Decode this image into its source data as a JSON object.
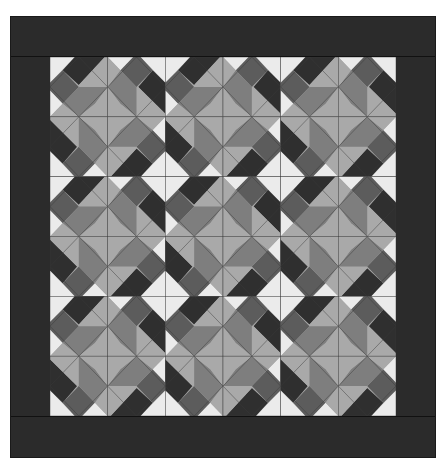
{
  "image": {
    "subject": "quilt-pattern",
    "description": "Grayscale quilt: 3x3 grid of identical pieced blocks, each made of 2x2 pinwheel units, surrounded by a wide dark border",
    "grid": {
      "block_rows": 3,
      "block_cols": 3,
      "units_per_block": [
        2,
        2
      ]
    }
  },
  "colors": {
    "border": "#2b2b2b",
    "white": "#ebebeb",
    "dark": "#2f2f2f",
    "medium_dark": "#5c5c5c",
    "medium": "#7e7e7e",
    "light": "#a9a9a9",
    "seam": "#3a3a3a"
  }
}
